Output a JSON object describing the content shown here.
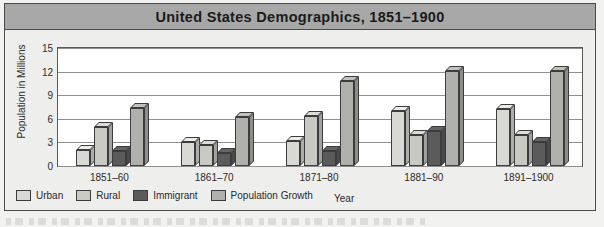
{
  "title": "United States  Demographics, 1851–1900",
  "chart_data": {
    "type": "bar",
    "title": "United States  Demographics, 1851–1900",
    "xlabel": "Year",
    "ylabel": "Population in Millions",
    "ylim": [
      0,
      15
    ],
    "yticks": [
      0,
      3,
      6,
      9,
      12,
      15
    ],
    "grid": true,
    "legend_position": "bottom-left",
    "style": "3d-bar",
    "categories": [
      "1851–60",
      "1861–70",
      "1871–80",
      "1881–90",
      "1891–1900"
    ],
    "series": [
      {
        "name": "Urban",
        "color": "#d8d8d4",
        "values": [
          2.0,
          3.0,
          3.2,
          7.0,
          7.2
        ]
      },
      {
        "name": "Rural",
        "color": "#c9c9c4",
        "values": [
          5.0,
          2.7,
          6.4,
          3.9,
          3.9
        ]
      },
      {
        "name": "Immigrant",
        "color": "#5b5b5b",
        "values": [
          1.9,
          1.6,
          1.9,
          4.5,
          3.0
        ]
      },
      {
        "name": "Population Growth",
        "color": "#b0b0ac",
        "values": [
          7.4,
          6.2,
          10.8,
          12.1,
          12.1
        ]
      }
    ]
  },
  "axes": {
    "y_title": "Population in Millions",
    "x_title": "Year",
    "y_ticks": [
      "0",
      "3",
      "6",
      "9",
      "12",
      "15"
    ],
    "x_ticks": [
      "1851–60",
      "1861–70",
      "1871–80",
      "1881–90",
      "1891–1900"
    ]
  },
  "legend": {
    "items": [
      {
        "label": "Urban",
        "color": "#d8d8d4"
      },
      {
        "label": "Rural",
        "color": "#c9c9c4"
      },
      {
        "label": "Immigrant",
        "color": "#5b5b5b"
      },
      {
        "label": "Population Growth",
        "color": "#b0b0ac"
      }
    ]
  },
  "colors": {
    "title_band": "#a8a8a8",
    "frame_border": "#4a4a4a",
    "plot_background": "#ffffff",
    "gridline": "#8f8f8f",
    "page_background": "#eeeeec",
    "text": "#2a2a2a"
  }
}
